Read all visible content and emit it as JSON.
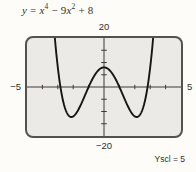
{
  "colors": {
    "page_bg": "#fdfcf8",
    "screen_bg": "#eceae6",
    "screen_border": "#55524d",
    "axis": "#3d3b38",
    "curve": "#161616",
    "text": "#332f2b"
  },
  "equation": {
    "var1": "y",
    "op1": " = ",
    "var2": "x",
    "sup1": "4",
    "op2": " − 9",
    "var3": "x",
    "sup2": "2",
    "op3": " + 8"
  },
  "labels": {
    "ymax": "20",
    "ymin": "−20",
    "xmin": "−5",
    "xmax": "5",
    "yscl": "Yscl = 5"
  },
  "chart_data": {
    "type": "line",
    "function": "y = x^4 - 9x^2 + 8",
    "coefficients": {
      "x4": 1,
      "x3": 0,
      "x2": -9,
      "x1": 0,
      "x0": 8
    },
    "window": {
      "xmin": -5,
      "xmax": 5,
      "ymin": -20,
      "ymax": 20,
      "xscl": 1,
      "yscl": 5
    },
    "axis_tick_labels_shown": [
      "20",
      "−20",
      "−5",
      "5"
    ],
    "yscl_note": "Yscl = 5",
    "y_intercept": 8,
    "x_intercepts": [
      -2.83,
      -1,
      1,
      2.83
    ],
    "local_max": {
      "x": 0,
      "y": 8
    },
    "local_min": [
      {
        "x": -2.12,
        "y": -12.25
      },
      {
        "x": 2.12,
        "y": -12.25
      }
    ],
    "grid": false,
    "legend": "none"
  }
}
